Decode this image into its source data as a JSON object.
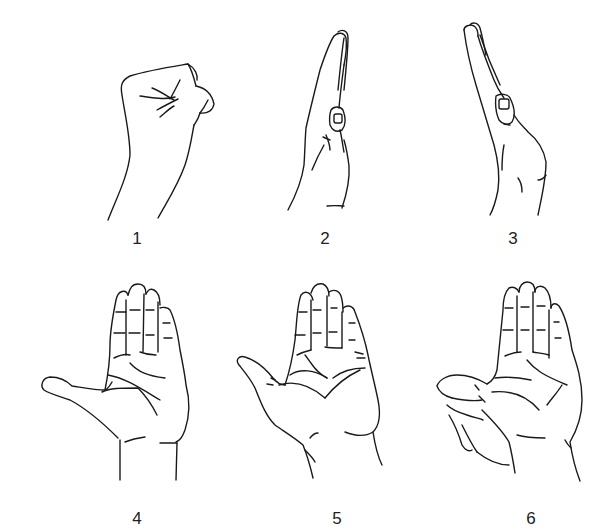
{
  "figure": {
    "panels": [
      {
        "label": "1",
        "pose": "closed-fist"
      },
      {
        "label": "2",
        "pose": "flat-hand-side-view-thumb-adducted"
      },
      {
        "label": "3",
        "pose": "flat-hand-side-view-thumb-flexed"
      },
      {
        "label": "4",
        "pose": "open-palm-thumb-abducted-extended"
      },
      {
        "label": "5",
        "pose": "open-palm-thumb-abducted-raised"
      },
      {
        "label": "6",
        "pose": "open-palm-thumb-opposed-by-other-hand"
      }
    ]
  },
  "colors": {
    "line": "#1a1a1a",
    "background": "#ffffff",
    "label": "#222222"
  }
}
